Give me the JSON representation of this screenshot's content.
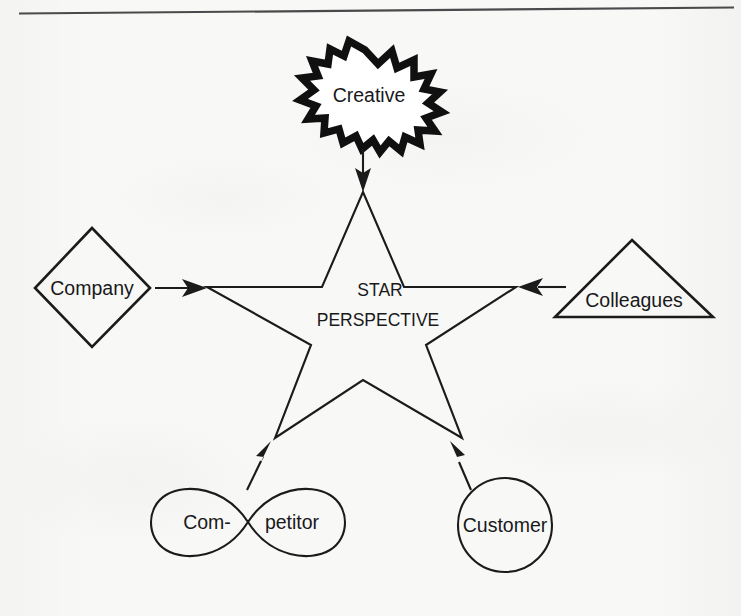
{
  "page": {
    "background_color": "#f8f8f7",
    "ink_color": "#1b1b1c",
    "divider": {
      "name": "top-rule",
      "visible": true
    }
  },
  "diagram": {
    "type": "radial concept diagram",
    "center": {
      "shape": "five-pointed-star",
      "label_line1": "STAR",
      "label_line2": "PERSPECTIVE"
    },
    "nodes": [
      {
        "id": "creative",
        "label": "Creative",
        "shape": "explosion-burst",
        "position": "top",
        "arrow_to": "center",
        "arrow_direction": "down"
      },
      {
        "id": "company",
        "label": "Company",
        "shape": "diamond",
        "position": "left",
        "arrow_to": "center",
        "arrow_direction": "right"
      },
      {
        "id": "colleagues",
        "label": "Colleagues",
        "shape": "triangle",
        "position": "right",
        "arrow_to": "center",
        "arrow_direction": "left"
      },
      {
        "id": "competitor",
        "label": "Com-petitor",
        "label_part1": "Com-",
        "label_part2": "petitor",
        "shape": "infinity-lemniscate",
        "position": "bottom-left",
        "arrow_to": "center",
        "arrow_direction": "up-right"
      },
      {
        "id": "customer",
        "label": "Customer",
        "shape": "circle",
        "position": "bottom-right",
        "arrow_to": "center",
        "arrow_direction": "up-left"
      }
    ]
  }
}
